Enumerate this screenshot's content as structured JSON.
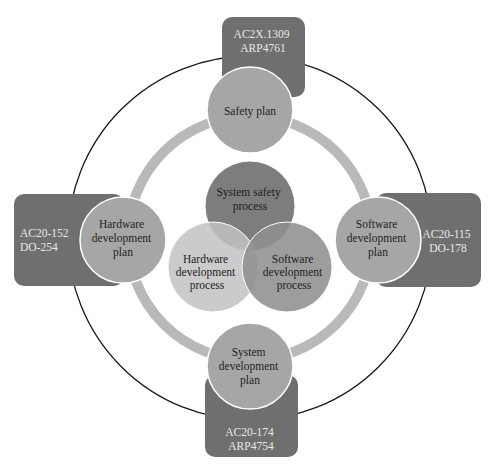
{
  "diagram": {
    "colors": {
      "outer_ring": "#1a1a1a",
      "inner_ring": "#b9b9b9",
      "standard_box": "#6f6f6f",
      "plan_circle": "#a6a6a6",
      "plan_circle_stroke": "#ffffff",
      "venn_top": "#7d7d7d",
      "venn_left": "#c2c2c2",
      "venn_right": "#929292"
    },
    "standards": {
      "top": {
        "line1": "AC2X.1309",
        "line2": "ARP4761"
      },
      "left": {
        "line1": "AC20-152",
        "line2": "DO-254"
      },
      "right": {
        "line1": "AC20-115",
        "line2": "DO-178"
      },
      "bottom": {
        "line1": "AC20-174",
        "line2": "ARP4754"
      }
    },
    "plans": {
      "top": {
        "line1": "Safety plan"
      },
      "left": {
        "line1": "Hardware",
        "line2": "development",
        "line3": "plan"
      },
      "right": {
        "line1": "Software",
        "line2": "development",
        "line3": "plan"
      },
      "bottom": {
        "line1": "System",
        "line2": "development",
        "line3": "plan"
      }
    },
    "processes": {
      "top": {
        "line1": "System safety",
        "line2": "process"
      },
      "left": {
        "line1": "Hardware",
        "line2": "development",
        "line3": "process"
      },
      "right": {
        "line1": "Software",
        "line2": "development",
        "line3": "process"
      }
    }
  }
}
